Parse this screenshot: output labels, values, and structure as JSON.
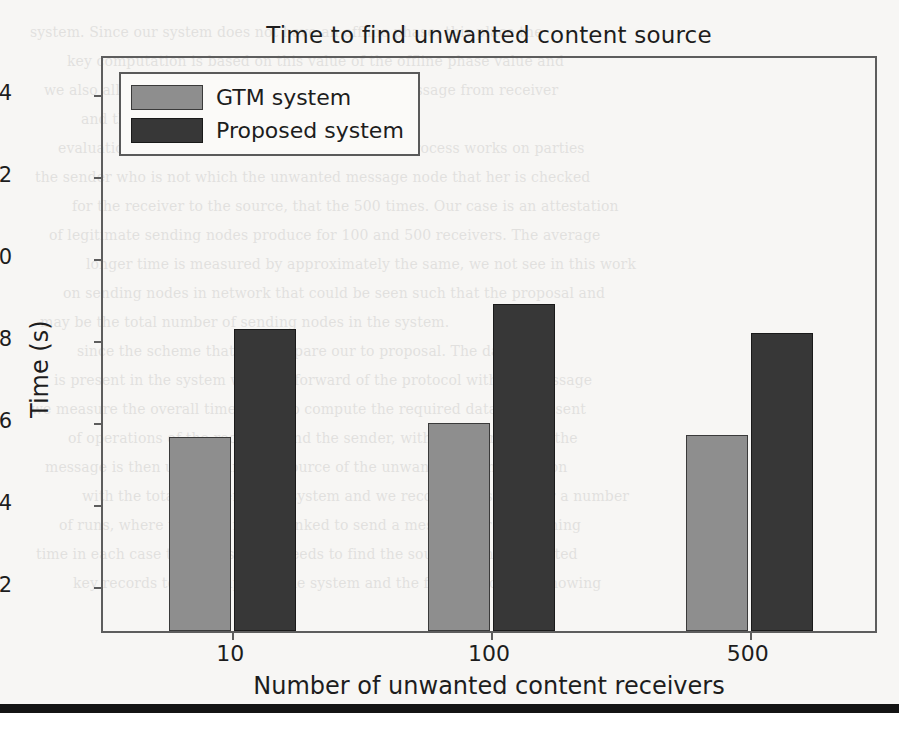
{
  "chart_data": {
    "type": "bar",
    "title": "Time to find unwanted content source",
    "xlabel": "Number of unwanted content receivers",
    "ylabel": "Time (s)",
    "categories": [
      "10",
      "100",
      "500"
    ],
    "series": [
      {
        "name": "GTM system",
        "color": "#8e8e8e",
        "values": [
          5.55,
          5.9,
          5.6
        ]
      },
      {
        "name": "Proposed system",
        "color": "#373737",
        "values": [
          8.2,
          8.8,
          8.1
        ]
      }
    ],
    "yticks": [
      2,
      4,
      6,
      8,
      10,
      12,
      14
    ],
    "ytick_labels": [
      "2",
      "4",
      "6",
      "8",
      "10",
      "12",
      "14"
    ],
    "ylim": [
      0.83,
      14.9
    ],
    "grid": false,
    "legend_position": "upper left"
  },
  "legend": {
    "items": [
      {
        "label": "GTM system"
      },
      {
        "label": "Proposed system"
      }
    ]
  },
  "ghost_text": {
    "lines": [
      "system. Since our system does not have an offline phase, this place the",
      "key computation is based on this value of the offline phase value and",
      "we also allow it to handle checks to a particular message from receiver",
      "and the sending node.",
      "evaluation and an unauthorized source sending process works on parties",
      "the sender who is not which the unwanted message node that her is checked",
      "for the receiver to the source, that the 500 times. Our case is an attestation",
      "of legitimate sending nodes produce for 100 and 500 receivers. The average",
      "longer time is measured by approximately the same, we not see in this work",
      "on sending nodes in network that could be seen such that the proposal and",
      "may be the total number of sending nodes in the system.",
      "since the scheme that we compare our to proposal. The data flow",
      "is present in the system with the forward of the protocol with the message",
      "we measure the overall time taken to compute the required data as that sent",
      "of operations of the receivers and the sender, with the overall time the",
      "message is then used to find the source of the unwanted communication",
      "with the total number of the system and we recorded results over a number",
      "of runs, where the time for the linked to send a message for the running",
      "time in each case that the system needs to find the source of the unwanted",
      "key records to be completed the system and the fact that only is knowing"
    ]
  }
}
